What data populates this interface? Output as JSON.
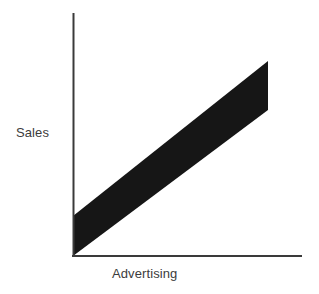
{
  "chart_data": {
    "type": "line",
    "title": "",
    "subtitle": "",
    "xlabel": "Advertising",
    "ylabel": "Sales",
    "annotations": [],
    "legend": [],
    "legend_position": "none",
    "grid": false,
    "axis_ticks": false,
    "tick_labels": {
      "x": [],
      "y": []
    },
    "xlim": [
      0,
      1
    ],
    "ylim": [
      0,
      1
    ],
    "series": [
      {
        "name": "Sales vs Advertising",
        "style": "thick-band",
        "color": "#161616",
        "band_thickness_px": 40,
        "x": [
          0,
          1
        ],
        "y": [
          0,
          1
        ],
        "description": "Positive linear relationship rendered as a thick black diagonal band rising from the origin to the upper right"
      }
    ],
    "axes": {
      "color": "#3a3a3a",
      "line_width_px": 2,
      "y_axis_x_px": 73,
      "y_axis_top_px": 13,
      "x_axis_y_px": 256,
      "x_axis_right_px": 302,
      "origin_px": [
        73,
        256
      ]
    }
  },
  "figure": {
    "background": "#ffffff",
    "label_color": "#3c3c3c"
  }
}
